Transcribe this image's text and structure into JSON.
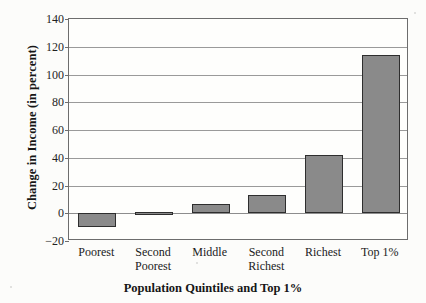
{
  "chart_data": {
    "type": "bar",
    "title": "",
    "xlabel": "Population Quintiles and Top 1%",
    "ylabel": "Change in Income (in percent)",
    "categories": [
      "Poorest",
      "Second Poorest",
      "Middle",
      "Second Richest",
      "Richest",
      "Top 1%"
    ],
    "category_lines": [
      [
        "Poorest",
        ""
      ],
      [
        "Second",
        "Poorest"
      ],
      [
        "Middle",
        ""
      ],
      [
        "Second",
        "Richest"
      ],
      [
        "Richest",
        ""
      ],
      [
        "Top 1%",
        ""
      ]
    ],
    "values": [
      -10,
      1,
      7,
      13,
      42,
      114
    ],
    "ylim": [
      -20,
      140
    ],
    "ytick_labels": [
      "140",
      "120",
      "100",
      "80",
      "60",
      "40",
      "20",
      "0",
      "−20"
    ],
    "ytick_values": [
      140,
      120,
      100,
      80,
      60,
      40,
      20,
      0,
      -20
    ],
    "grid": true,
    "legend": "none",
    "bar_fill_color": "#8a8a8a",
    "bar_edge_color": "#2e2e2e",
    "background_color": "#fcfcfa",
    "gridline_color": "#9a9a9a"
  }
}
